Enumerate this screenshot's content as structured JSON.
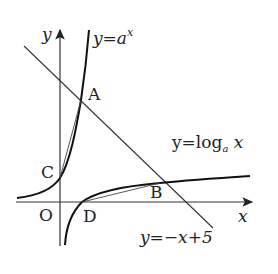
{
  "diagram": {
    "axes": {
      "x_label": "x",
      "y_label": "y",
      "origin_label": "O"
    },
    "curves": {
      "exp": {
        "label_prefix": "y=a",
        "label_exp": "x"
      },
      "log": {
        "label_prefix": "y=log",
        "label_sub": "a",
        "label_suffix": " x"
      },
      "line": {
        "label": "y=−x+5"
      }
    },
    "points": {
      "A": "A",
      "B": "B",
      "C": "C",
      "D": "D"
    },
    "colors": {
      "stroke": "#1a1a1a",
      "background": "#ffffff"
    }
  }
}
